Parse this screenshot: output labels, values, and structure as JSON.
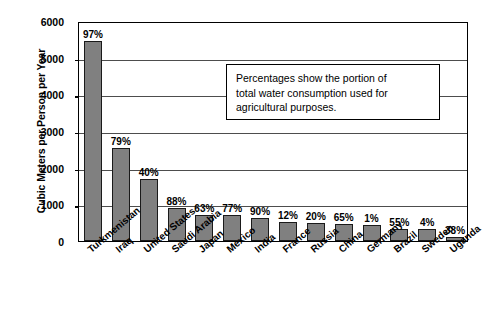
{
  "chart_data": {
    "type": "bar",
    "title": "",
    "xlabel": "",
    "ylabel": "Cubic Meters per Person per Year",
    "ylim": [
      0,
      6000
    ],
    "ytick_labels": [
      "6000",
      "5000",
      "4000",
      "3000",
      "2000",
      "1000",
      "0"
    ],
    "ytick_values": [
      6000,
      5000,
      4000,
      3000,
      2000,
      1000,
      0
    ],
    "grid": true,
    "legend": null,
    "categories": [
      "Turkmenistan",
      "Iraq",
      "United States",
      "Saudi Arabia",
      "Japan",
      "Mexico",
      "India",
      "France",
      "Russia",
      "China",
      "Germany",
      "Brazil",
      "Sweden",
      "Uganda"
    ],
    "values": [
      5450,
      2550,
      1700,
      900,
      720,
      720,
      620,
      530,
      490,
      470,
      440,
      330,
      330,
      100
    ],
    "data_labels": [
      "97%",
      "79%",
      "40%",
      "88%",
      "63%",
      "77%",
      "90%",
      "12%",
      "20%",
      "65%",
      "1%",
      "55%",
      "4%",
      "38%"
    ],
    "annotation": {
      "line1": "Percentages show the portion of",
      "line2": "total water consumption used for",
      "line3": "agricultural purposes."
    },
    "colors": {
      "bar_fill": "#808080",
      "bar_edge": "#1a1a1a",
      "grid": "#4d4d4d",
      "frame": "#000000",
      "text": "#000000",
      "background": "#ffffff"
    }
  }
}
